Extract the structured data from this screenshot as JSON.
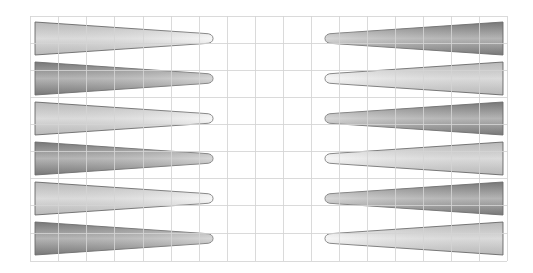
{
  "board": {
    "type": "backgammon-board-rotated",
    "background": "#ffffff",
    "grid": {
      "color": "#d4d4d4",
      "x_lines": [
        30,
        58,
        86,
        114,
        143,
        171,
        199,
        227,
        255,
        283,
        311,
        339,
        367,
        395,
        423,
        451,
        479,
        507
      ],
      "y_lines": [
        16,
        43,
        70,
        97,
        124,
        151,
        178,
        205,
        233,
        261
      ]
    },
    "colors": {
      "dark_edge": "#858585",
      "dark_mid": "#c9c9c9",
      "light_edge": "#cdcdcd",
      "light_mid": "#f3f3f3",
      "outline": "#7a7a7a"
    },
    "left_points": [
      {
        "index": 1,
        "shade": "light"
      },
      {
        "index": 2,
        "shade": "dark"
      },
      {
        "index": 3,
        "shade": "light"
      },
      {
        "index": 4,
        "shade": "dark"
      },
      {
        "index": 5,
        "shade": "light"
      },
      {
        "index": 6,
        "shade": "dark"
      }
    ],
    "right_points": [
      {
        "index": 1,
        "shade": "dark"
      },
      {
        "index": 2,
        "shade": "light"
      },
      {
        "index": 3,
        "shade": "dark"
      },
      {
        "index": 4,
        "shade": "light"
      },
      {
        "index": 5,
        "shade": "dark"
      },
      {
        "index": 6,
        "shade": "light"
      }
    ],
    "geometry": {
      "row_tops": [
        22,
        62,
        102,
        142,
        182,
        222
      ],
      "point_height": 33,
      "left_base_x": 35,
      "left_tip_x": 213,
      "right_base_x": 503,
      "right_tip_x": 325
    }
  }
}
